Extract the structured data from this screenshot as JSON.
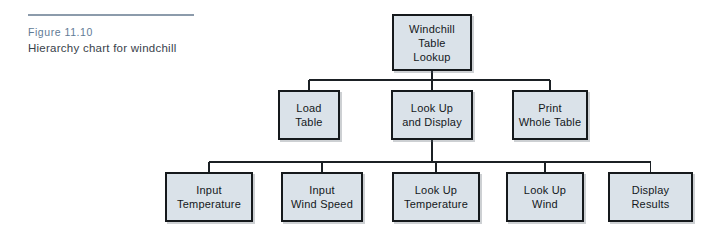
{
  "caption": {
    "figure_number": "Figure 11.10",
    "title": "Hierarchy chart for windchill"
  },
  "chart_data": {
    "type": "diagram",
    "diagram_kind": "hierarchy-chart",
    "title": "Hierarchy chart for windchill",
    "levels": 3,
    "colors": {
      "box_fill": "#dae2e9",
      "box_border": "#15191c",
      "connector": "#1b2024",
      "caption_figure": "#5f7b96",
      "caption_title": "#39424b",
      "rule": "#8c9bab"
    },
    "nodes": [
      {
        "id": "root",
        "label": "Windchill\nTable\nLookup",
        "level": 1,
        "x": 392,
        "y": 14,
        "w": 80,
        "h": 57
      },
      {
        "id": "load",
        "label": "Load\nTable",
        "level": 2,
        "x": 278,
        "y": 90,
        "w": 62,
        "h": 50
      },
      {
        "id": "lookdisp",
        "label": "Look Up\nand Display",
        "level": 2,
        "x": 391,
        "y": 90,
        "w": 82,
        "h": 50
      },
      {
        "id": "printwhole",
        "label": "Print\nWhole Table",
        "level": 2,
        "x": 512,
        "y": 90,
        "w": 76,
        "h": 50
      },
      {
        "id": "inputtemp",
        "label": "Input\nTemperature",
        "level": 3,
        "x": 165,
        "y": 172,
        "w": 88,
        "h": 50
      },
      {
        "id": "inputwind",
        "label": "Input\nWind Speed",
        "level": 3,
        "x": 281,
        "y": 172,
        "w": 82,
        "h": 50
      },
      {
        "id": "lookuptemp",
        "label": "Look Up\nTemperature",
        "level": 3,
        "x": 392,
        "y": 172,
        "w": 88,
        "h": 50
      },
      {
        "id": "lookupwind",
        "label": "Look Up\nWind",
        "level": 3,
        "x": 506,
        "y": 172,
        "w": 78,
        "h": 50
      },
      {
        "id": "displayres",
        "label": "Display\nResults",
        "level": 3,
        "x": 608,
        "y": 172,
        "w": 85,
        "h": 50
      }
    ],
    "edges": [
      {
        "from": "root",
        "to": "load"
      },
      {
        "from": "root",
        "to": "lookdisp"
      },
      {
        "from": "root",
        "to": "printwhole"
      },
      {
        "from": "lookdisp",
        "to": "inputtemp"
      },
      {
        "from": "lookdisp",
        "to": "inputwind"
      },
      {
        "from": "lookdisp",
        "to": "lookuptemp"
      },
      {
        "from": "lookdisp",
        "to": "lookupwind"
      },
      {
        "from": "lookdisp",
        "to": "displayres"
      }
    ],
    "buses": [
      {
        "id": "bus-level2",
        "y": 80,
        "x1": 309,
        "x2": 550
      },
      {
        "id": "bus-level3",
        "y": 162,
        "x1": 209,
        "x2": 650
      }
    ]
  }
}
